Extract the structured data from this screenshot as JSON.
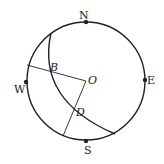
{
  "diagram": {
    "type": "geometry-compass-circle",
    "labels": {
      "north": "N",
      "east": "E",
      "south": "S",
      "west": "W",
      "center": "O",
      "point_b": "B",
      "point_d": "D"
    },
    "colors": {
      "stroke": "#222222",
      "background": "#ffffff"
    }
  }
}
